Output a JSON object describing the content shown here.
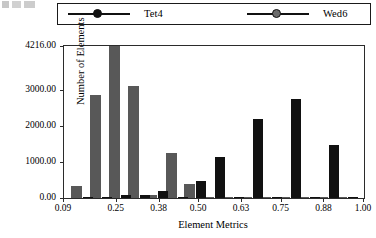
{
  "chart_data": {
    "type": "bar",
    "title": "",
    "xlabel": "Element Metrics",
    "ylabel": "Number of Elements",
    "xlim": [
      0.09,
      1.0
    ],
    "ylim": [
      0,
      4216
    ],
    "grid": false,
    "legend_position": "top",
    "xticks": [
      "0.09",
      "0.25",
      "0.38",
      "0.50",
      "0.63",
      "0.75",
      "0.88",
      "1.00"
    ],
    "xtick_values": [
      0.09,
      0.25,
      0.38,
      0.5,
      0.63,
      0.75,
      0.88,
      1.0
    ],
    "yticks": [
      "0.00",
      "1000.00",
      "2000.00",
      "3000.00",
      "4216.00"
    ],
    "ytick_values": [
      0,
      1000,
      2000,
      3000,
      4216
    ],
    "colors": {
      "tet4": "#111111",
      "wed6": "#585858",
      "axis": "#2b2b2b",
      "background": "#ffffff"
    },
    "x": [
      0.145,
      0.203,
      0.26,
      0.318,
      0.375,
      0.433,
      0.49,
      0.548,
      0.605,
      0.663,
      0.72,
      0.778,
      0.835,
      0.893,
      0.95
    ],
    "series": [
      {
        "name": "Wed6",
        "color": "#585858",
        "values": [
          330,
          2850,
          4216,
          3100,
          80,
          1250,
          390,
          30,
          25,
          20,
          15,
          12,
          10,
          8,
          6
        ]
      },
      {
        "name": "Tet4",
        "color": "#111111",
        "values": [
          25,
          20,
          70,
          95,
          185,
          40,
          470,
          1150,
          30,
          2200,
          35,
          2750,
          25,
          1470,
          20
        ]
      }
    ]
  },
  "legend": {
    "entries": [
      {
        "label": "Tet4",
        "color": "#111111"
      },
      {
        "label": "Wed6",
        "color": "#6b6b6b"
      }
    ]
  }
}
